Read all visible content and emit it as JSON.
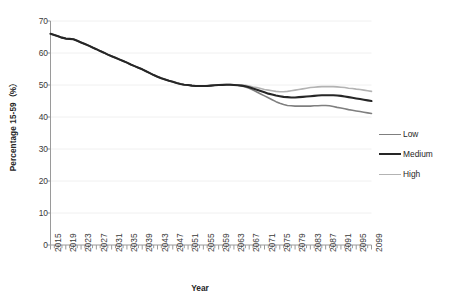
{
  "chart_data": {
    "type": "line",
    "title": "",
    "xlabel": "Year",
    "ylabel": "Percentage 15-59（%）",
    "xlim": [
      2015,
      2099
    ],
    "ylim": [
      0,
      70
    ],
    "yticks": [
      0,
      10,
      20,
      30,
      40,
      50,
      60,
      70
    ],
    "ytick_labels": [
      "0",
      "10",
      "20",
      "30",
      "40",
      "50",
      "60",
      "70"
    ],
    "xticks": [
      2015,
      2019,
      2023,
      2027,
      2031,
      2035,
      2039,
      2043,
      2047,
      2051,
      2055,
      2059,
      2063,
      2067,
      2071,
      2075,
      2079,
      2083,
      2087,
      2091,
      2095,
      2099
    ],
    "xtick_labels": [
      "2015",
      "2019",
      "2023",
      "2027",
      "2031",
      "2035",
      "2039",
      "2043",
      "2047",
      "2051",
      "2055",
      "2059",
      "2063",
      "2067",
      "2071",
      "2075",
      "2079",
      "2083",
      "2087",
      "2091",
      "2095",
      "2099"
    ],
    "xtick_minor_step": 1,
    "grid": {
      "horizontal": true,
      "vertical": false,
      "color": "#f0f0f0"
    },
    "legend_position": "right",
    "x": [
      2015,
      2016,
      2017,
      2018,
      2019,
      2020,
      2021,
      2022,
      2023,
      2024,
      2025,
      2026,
      2027,
      2028,
      2029,
      2030,
      2031,
      2032,
      2033,
      2034,
      2035,
      2036,
      2037,
      2038,
      2039,
      2040,
      2041,
      2042,
      2043,
      2044,
      2045,
      2046,
      2047,
      2048,
      2049,
      2050,
      2051,
      2052,
      2053,
      2054,
      2055,
      2056,
      2057,
      2058,
      2059,
      2060,
      2061,
      2062,
      2063,
      2064,
      2065,
      2066,
      2067,
      2068,
      2069,
      2070,
      2071,
      2072,
      2073,
      2074,
      2075,
      2076,
      2077,
      2078,
      2079,
      2080,
      2081,
      2082,
      2083,
      2084,
      2085,
      2086,
      2087,
      2088,
      2089,
      2090,
      2091,
      2092,
      2093,
      2094,
      2095,
      2096,
      2097,
      2098,
      2099
    ],
    "series": [
      {
        "name": "Low",
        "color": "#7f7f7f",
        "width": 1.6,
        "values": [
          66.0,
          65.6,
          65.2,
          64.8,
          64.5,
          64.4,
          64.3,
          63.8,
          63.3,
          62.8,
          62.3,
          61.7,
          61.2,
          60.6,
          60.1,
          59.5,
          59.0,
          58.5,
          58.0,
          57.5,
          57.0,
          56.4,
          55.9,
          55.4,
          54.9,
          54.3,
          53.7,
          53.1,
          52.6,
          52.1,
          51.7,
          51.3,
          51.0,
          50.6,
          50.3,
          50.1,
          50.0,
          49.8,
          49.7,
          49.7,
          49.7,
          49.7,
          49.8,
          49.9,
          50.0,
          50.0,
          50.1,
          50.1,
          50.0,
          49.9,
          49.7,
          49.4,
          49.0,
          48.4,
          47.8,
          47.2,
          46.6,
          46.0,
          45.4,
          44.8,
          44.3,
          43.9,
          43.6,
          43.5,
          43.4,
          43.4,
          43.4,
          43.4,
          43.4,
          43.5,
          43.5,
          43.6,
          43.6,
          43.5,
          43.3,
          43.0,
          42.8,
          42.6,
          42.3,
          42.1,
          41.9,
          41.7,
          41.5,
          41.3,
          41.1
        ]
      },
      {
        "name": "Medium",
        "color": "#262626",
        "width": 2.1,
        "values": [
          66.0,
          65.6,
          65.2,
          64.8,
          64.5,
          64.4,
          64.3,
          63.8,
          63.3,
          62.8,
          62.3,
          61.7,
          61.2,
          60.6,
          60.1,
          59.5,
          59.0,
          58.5,
          58.0,
          57.5,
          57.0,
          56.4,
          55.9,
          55.4,
          54.9,
          54.3,
          53.7,
          53.1,
          52.6,
          52.1,
          51.7,
          51.3,
          51.0,
          50.6,
          50.3,
          50.1,
          50.0,
          49.8,
          49.7,
          49.7,
          49.7,
          49.7,
          49.8,
          49.9,
          50.0,
          50.0,
          50.1,
          50.1,
          50.0,
          49.9,
          49.8,
          49.6,
          49.3,
          48.9,
          48.5,
          48.1,
          47.7,
          47.3,
          47.0,
          46.7,
          46.5,
          46.3,
          46.2,
          46.1,
          46.1,
          46.2,
          46.3,
          46.4,
          46.5,
          46.6,
          46.7,
          46.8,
          46.8,
          46.8,
          46.8,
          46.7,
          46.6,
          46.4,
          46.2,
          46.0,
          45.8,
          45.6,
          45.4,
          45.2,
          45.0
        ]
      },
      {
        "name": "High",
        "color": "#b3b3b3",
        "width": 1.6,
        "values": [
          66.0,
          65.6,
          65.2,
          64.8,
          64.5,
          64.4,
          64.3,
          63.8,
          63.3,
          62.8,
          62.3,
          61.7,
          61.2,
          60.6,
          60.1,
          59.5,
          59.0,
          58.5,
          58.0,
          57.5,
          57.0,
          56.4,
          55.9,
          55.4,
          54.9,
          54.3,
          53.7,
          53.1,
          52.6,
          52.1,
          51.7,
          51.3,
          51.0,
          50.6,
          50.3,
          50.1,
          50.0,
          49.8,
          49.7,
          49.7,
          49.7,
          49.8,
          49.9,
          50.0,
          50.1,
          50.2,
          50.2,
          50.2,
          50.1,
          50.1,
          50.0,
          49.9,
          49.7,
          49.4,
          49.2,
          48.9,
          48.6,
          48.4,
          48.2,
          48.0,
          47.9,
          47.9,
          48.0,
          48.2,
          48.4,
          48.6,
          48.8,
          49.0,
          49.2,
          49.3,
          49.4,
          49.5,
          49.5,
          49.5,
          49.5,
          49.4,
          49.3,
          49.2,
          49.0,
          48.9,
          48.7,
          48.6,
          48.4,
          48.2,
          48.0
        ]
      }
    ]
  },
  "legend": {
    "items": [
      {
        "label": "Low"
      },
      {
        "label": "Medium"
      },
      {
        "label": "High"
      }
    ]
  },
  "axes": {
    "x_title": "Year",
    "y_title": "Percentage 15-59（%）"
  }
}
